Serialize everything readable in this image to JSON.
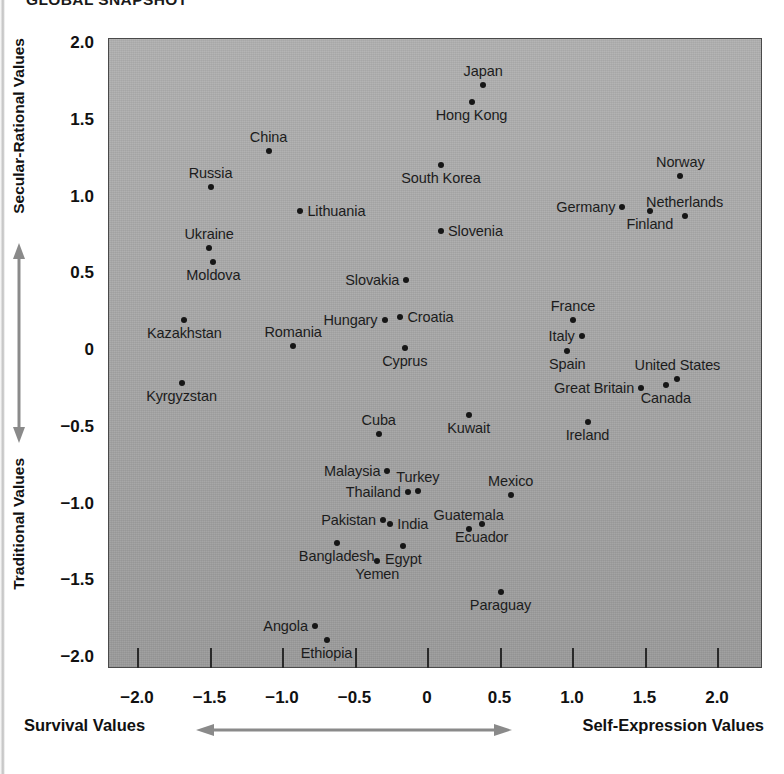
{
  "title": "GLOBAL SNAPSHOT",
  "colors": {
    "plot_background": "#a8a8a8",
    "plot_border": "#4a4a4a",
    "point": "#161616",
    "text": "#1a1a1a",
    "page_background": "#ffffff"
  },
  "axes": {
    "y": {
      "top_label": "Secular-Rational Values",
      "bottom_label": "Traditional Values",
      "ticks": [
        "2.0",
        "1.5",
        "1.0",
        "0.5",
        "0",
        "−0.5",
        "−1.0",
        "−1.5",
        "−2.0"
      ],
      "tick_values": [
        2.0,
        1.5,
        1.0,
        0.5,
        0,
        -0.5,
        -1.0,
        -1.5,
        -2.0
      ],
      "arrow": "double-headed-vertical-arrow"
    },
    "x": {
      "left_label": "Survival Values",
      "right_label": "Self-Expression Values",
      "ticks": [
        "−2.0",
        "−1.5",
        "−1.0",
        "−0.5",
        "0",
        "0.5",
        "1.0",
        "1.5",
        "2.0"
      ],
      "tick_values": [
        -2.0,
        -1.5,
        -1.0,
        -0.5,
        0,
        0.5,
        1.0,
        1.5,
        2.0
      ],
      "arrow": "double-headed-horizontal-arrow"
    }
  },
  "chart_data": {
    "type": "scatter",
    "title": "GLOBAL SNAPSHOT",
    "xlabel": "Survival Values ↔ Self-Expression Values",
    "ylabel": "Traditional Values ↔ Secular-Rational Values",
    "xlim": [
      -2.2,
      2.2
    ],
    "ylim": [
      -2.2,
      2.1
    ],
    "grid": false,
    "legend": "none",
    "points": [
      {
        "name": "Japan",
        "x": 0.38,
        "y": 1.73,
        "label_pos": "above"
      },
      {
        "name": "Hong Kong",
        "x": 0.3,
        "y": 1.62,
        "label_pos": "below"
      },
      {
        "name": "China",
        "x": -1.1,
        "y": 1.3,
        "label_pos": "above"
      },
      {
        "name": "South Korea",
        "x": 0.09,
        "y": 1.21,
        "label_pos": "below"
      },
      {
        "name": "Norway",
        "x": 1.74,
        "y": 1.14,
        "label_pos": "above"
      },
      {
        "name": "Russia",
        "x": -1.5,
        "y": 1.07,
        "label_pos": "above"
      },
      {
        "name": "Germany",
        "x": 1.34,
        "y": 0.94,
        "label_pos": "left"
      },
      {
        "name": "Netherlands",
        "x": 1.77,
        "y": 0.88,
        "label_pos": "above"
      },
      {
        "name": "Lithuania",
        "x": -0.88,
        "y": 0.91,
        "label_pos": "right"
      },
      {
        "name": "Finland",
        "x": 1.53,
        "y": 0.91,
        "label_pos": "below"
      },
      {
        "name": "Slovenia",
        "x": 0.09,
        "y": 0.78,
        "label_pos": "right"
      },
      {
        "name": "Ukraine",
        "x": -1.51,
        "y": 0.67,
        "label_pos": "above"
      },
      {
        "name": "Moldova",
        "x": -1.48,
        "y": 0.58,
        "label_pos": "below"
      },
      {
        "name": "Slovakia",
        "x": -0.15,
        "y": 0.46,
        "label_pos": "left"
      },
      {
        "name": "France",
        "x": 1.0,
        "y": 0.2,
        "label_pos": "above"
      },
      {
        "name": "Croatia",
        "x": -0.19,
        "y": 0.22,
        "label_pos": "right"
      },
      {
        "name": "Hungary",
        "x": -0.3,
        "y": 0.2,
        "label_pos": "left"
      },
      {
        "name": "Kazakhstan",
        "x": -1.68,
        "y": 0.2,
        "label_pos": "below"
      },
      {
        "name": "Italy",
        "x": 1.06,
        "y": 0.1,
        "label_pos": "left"
      },
      {
        "name": "Romania",
        "x": -0.93,
        "y": 0.03,
        "label_pos": "above"
      },
      {
        "name": "Cyprus",
        "x": -0.16,
        "y": 0.02,
        "label_pos": "below"
      },
      {
        "name": "Spain",
        "x": 0.96,
        "y": 0.0,
        "label_pos": "below"
      },
      {
        "name": "United States",
        "x": 1.72,
        "y": -0.18,
        "label_pos": "above"
      },
      {
        "name": "Canada",
        "x": 1.64,
        "y": -0.22,
        "label_pos": "below"
      },
      {
        "name": "Great Britain",
        "x": 1.47,
        "y": -0.24,
        "label_pos": "left"
      },
      {
        "name": "Kyrgyzstan",
        "x": -1.7,
        "y": -0.21,
        "label_pos": "below"
      },
      {
        "name": "Kuwait",
        "x": 0.28,
        "y": -0.42,
        "label_pos": "below"
      },
      {
        "name": "Ireland",
        "x": 1.1,
        "y": -0.46,
        "label_pos": "below"
      },
      {
        "name": "Cuba",
        "x": -0.34,
        "y": -0.54,
        "label_pos": "above"
      },
      {
        "name": "Malaysia",
        "x": -0.28,
        "y": -0.78,
        "label_pos": "left"
      },
      {
        "name": "Turkey",
        "x": -0.07,
        "y": -0.91,
        "label_pos": "above"
      },
      {
        "name": "Mexico",
        "x": 0.57,
        "y": -0.94,
        "label_pos": "above"
      },
      {
        "name": "Thailand",
        "x": -0.14,
        "y": -0.92,
        "label_pos": "left"
      },
      {
        "name": "Pakistan",
        "x": -0.31,
        "y": -1.1,
        "label_pos": "left"
      },
      {
        "name": "India",
        "x": -0.26,
        "y": -1.13,
        "label_pos": "right"
      },
      {
        "name": "Guatemala",
        "x": 0.28,
        "y": -1.16,
        "label_pos": "above"
      },
      {
        "name": "Ecuador",
        "x": 0.37,
        "y": -1.13,
        "label_pos": "below"
      },
      {
        "name": "Bangladesh",
        "x": -0.63,
        "y": -1.25,
        "label_pos": "below"
      },
      {
        "name": "Egypt",
        "x": -0.17,
        "y": -1.27,
        "label_pos": "below"
      },
      {
        "name": "Yemen",
        "x": -0.35,
        "y": -1.37,
        "label_pos": "below"
      },
      {
        "name": "Paraguay",
        "x": 0.5,
        "y": -1.57,
        "label_pos": "below"
      },
      {
        "name": "Angola",
        "x": -0.78,
        "y": -1.79,
        "label_pos": "left"
      },
      {
        "name": "Ethiopia",
        "x": -0.7,
        "y": -1.88,
        "label_pos": "below"
      }
    ]
  }
}
